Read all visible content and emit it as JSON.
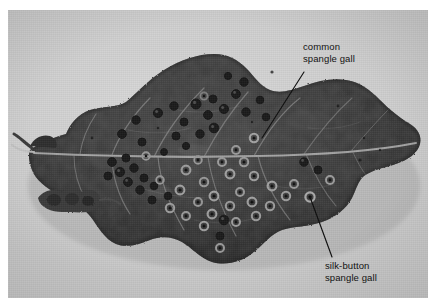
{
  "figure": {
    "kind": "photograph",
    "background_color": "#d2d2d2",
    "page_color": "#ffffff",
    "leaf_color": "#3a3a3a",
    "annotation_color": "#121212"
  },
  "annotations": [
    {
      "id": "common-spangle-gall",
      "line1": "common",
      "line2": "spangle gall",
      "leader": {
        "x1": 296,
        "y1": 62,
        "x2": 254,
        "y2": 128
      }
    },
    {
      "id": "silk-button-spangle-gall",
      "line1": "silk-button",
      "line2": "spangle gall",
      "leader": {
        "x1": 324,
        "y1": 247,
        "x2": 302,
        "y2": 187
      }
    }
  ]
}
